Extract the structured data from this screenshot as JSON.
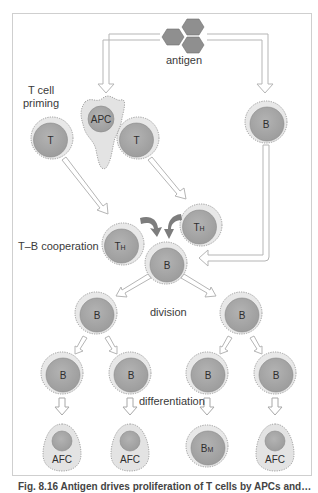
{
  "diagram": {
    "header_partial": "…",
    "labels": {
      "antigen": "antigen",
      "t_cell_priming_line1": "T cell",
      "t_cell_priming_line2": "priming",
      "tb_cooperation": "T–B cooperation",
      "division": "division",
      "differentiation": "differentiation"
    },
    "cells": {
      "apc": "APC",
      "t_left": "T",
      "t_right": "T",
      "b_naive": "B",
      "th_left": "T",
      "th_left_sub": "H",
      "th_right": "T",
      "th_right_sub": "H",
      "b_center": "B",
      "b_div_left": "B",
      "b_div_right": "B",
      "b_row1": "B",
      "b_row2": "B",
      "b_row3": "B",
      "b_row4": "B",
      "afc1": "AFC",
      "afc2": "AFC",
      "bm": "B",
      "bm_sub": "M",
      "afc4": "AFC"
    },
    "caption": "Fig. 8.16  Antigen drives proliferation of T cells by APCs and…"
  },
  "colors": {
    "frame": "#c9c9c9",
    "cell_outer": "#e6e6e6",
    "cell_inner": "#a9a9a9",
    "apc_body": "#e3e3e3",
    "antigen": "#8f8f8f",
    "arrow_fill": "#ffffff",
    "arrow_stroke": "#b5b5b5",
    "cooperation_arrow": "#7d7d7d"
  }
}
